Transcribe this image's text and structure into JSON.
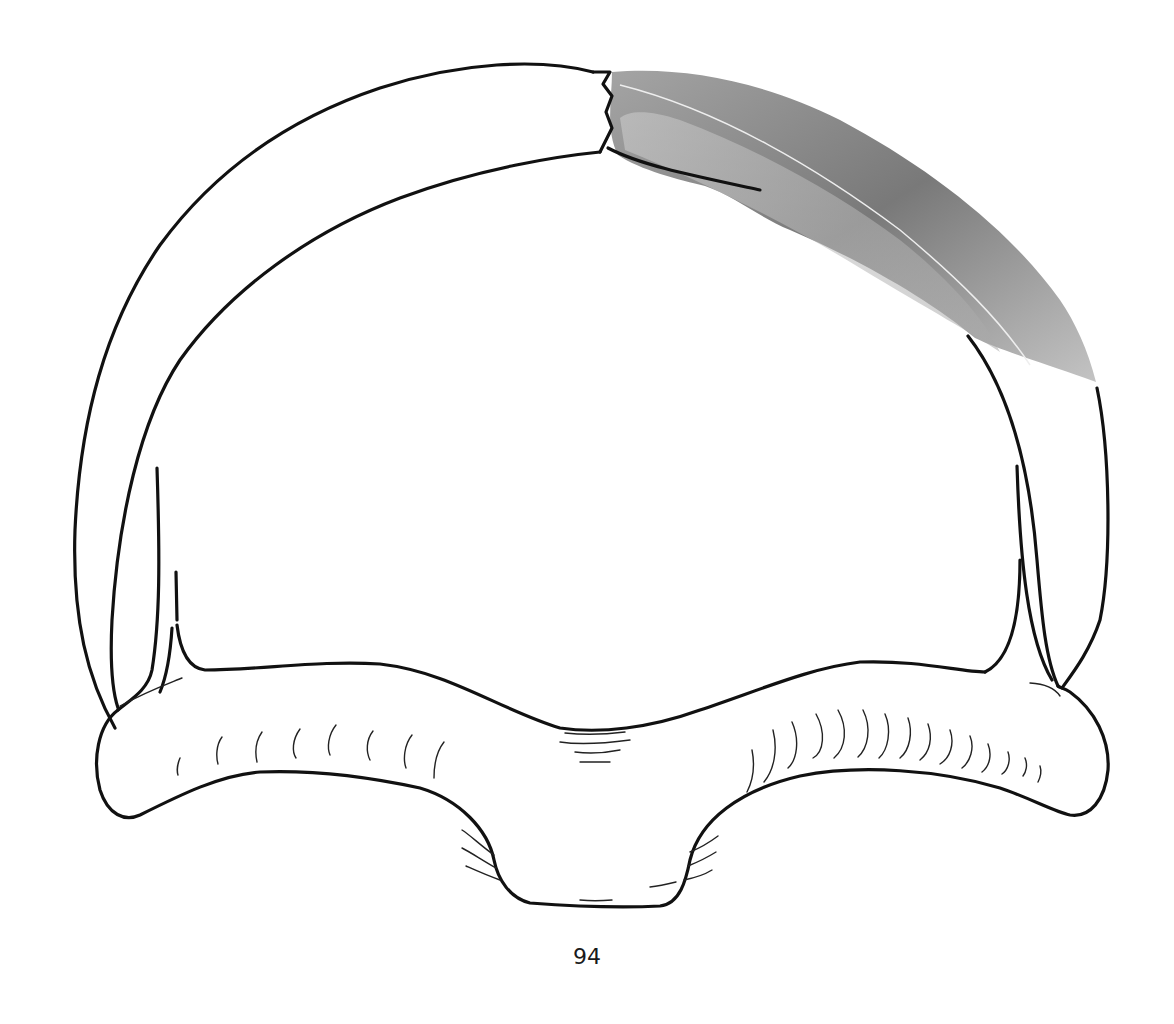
{
  "page": {
    "page_number": "94"
  },
  "figure": {
    "outline_color": "#111111",
    "shading_color_dark": "#555555",
    "shading_color_light": "#b5b5b5",
    "background": "#ffffff"
  }
}
